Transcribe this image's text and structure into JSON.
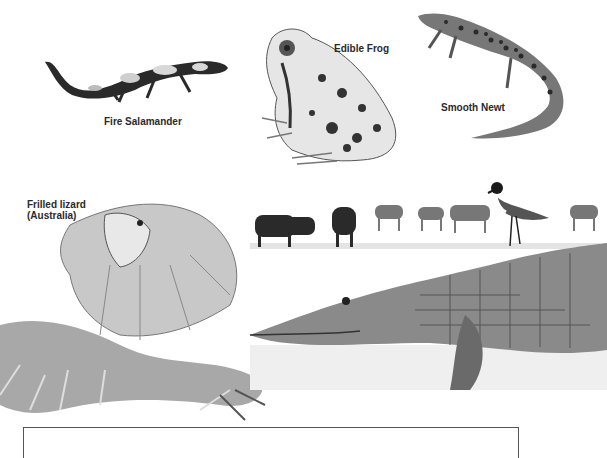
{
  "page": {
    "type": "illustration-plate",
    "background": "#ffffff"
  },
  "labels": {
    "fire_salamander": "Fire Salamander",
    "edible_frog": "Edible Frog",
    "smooth_newt": "Smooth Newt",
    "frilled_lizard_line1": "Frilled lizard",
    "frilled_lizard_line2": "(Australia)"
  },
  "illustrations": [
    {
      "name": "fire-salamander",
      "tone": "black with pale blotches"
    },
    {
      "name": "edible-frog",
      "tone": "pale grey with dark spots"
    },
    {
      "name": "smooth-newt",
      "tone": "spotted with crested tail"
    },
    {
      "name": "frilled-lizard",
      "tone": "grey, frill extended"
    },
    {
      "name": "savanna-background",
      "contents": [
        "buffalo",
        "buffalo",
        "antelope",
        "antelope",
        "antelope",
        "antelope"
      ]
    },
    {
      "name": "spur-winged-plover",
      "tone": "black and white"
    },
    {
      "name": "crocodile",
      "tone": "grey scaled"
    }
  ],
  "colors": {
    "ink": "#2a2a2a",
    "mid": "#888888",
    "light": "#cfcfcf",
    "frame": "#555555"
  }
}
